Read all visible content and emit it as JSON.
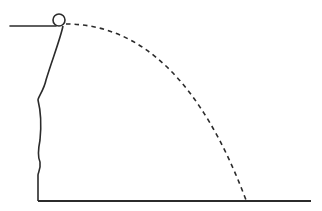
{
  "diagram": {
    "title": "Projectile launched horizontally from a cliff",
    "colors": {
      "line": "#2b2b2b",
      "background": "#ffffff"
    },
    "elements": {
      "ledge": {
        "x1": 10,
        "y1": 26,
        "x2": 56,
        "y2": 26
      },
      "ball": {
        "cx": 59,
        "cy": 20,
        "r": 6
      },
      "cliff_face": "M63,26 C60,40 52,60 46,80 C44,90 38,97 38,100 C40,108 42,120 40,140 C38,150 38,158 40,162 C41,170 38,172 38,175 L38,201",
      "ground": {
        "x1": 38,
        "y1": 201,
        "x2": 311,
        "y2": 201
      },
      "trajectory": "M66,24 Q180,24 246,200"
    }
  }
}
